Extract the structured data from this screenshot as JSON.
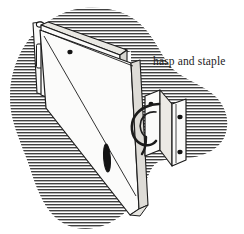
{
  "figure": {
    "kind": "technical-line-illustration",
    "style": "engraving-hatched",
    "width": 244,
    "height": 234,
    "background_color": "#ffffff",
    "ink_color": "#1c1c1c",
    "hatch_color": "#2b2b2b",
    "metal_fill_color": "#fbfbfa",
    "metal_shadow_color": "#d8d7d2",
    "hole_color": "#141414"
  },
  "caption": {
    "label": "hasp and staple",
    "x": 153,
    "y": 65,
    "font_size": 11.5,
    "color": "#1c1c1c"
  },
  "parts": [
    {
      "name": "hasp-strap",
      "label": "hasp",
      "description": "long tapering hinged strap with slot and screw holes"
    },
    {
      "name": "hasp-hinge-plate",
      "label": "hinge plate",
      "description": "rectangular mounting plate at the hinge end with four screw holes"
    },
    {
      "name": "staple-bracket",
      "label": "staple",
      "description": "L-shaped bracket carrying the looped staple hook"
    },
    {
      "name": "staple-loop",
      "label": "staple loop",
      "description": "curved metal loop the hasp slot drops over"
    }
  ],
  "hatching": {
    "orientation": "horizontal",
    "line_spacing": 3,
    "line_width": 1.6,
    "color": "#2b2b2b"
  },
  "hole_count": {
    "hinge_plate": 4,
    "strap": 2,
    "staple_front": 2,
    "staple_side": 2
  }
}
